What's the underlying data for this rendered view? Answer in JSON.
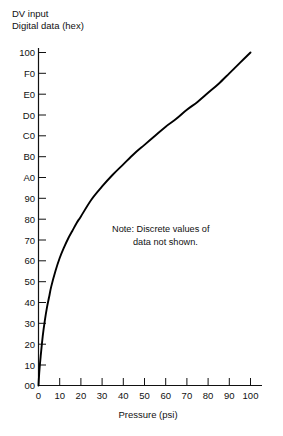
{
  "chart_data": {
    "type": "line",
    "title": "",
    "ylabel": "DV input\nDigital data (hex)",
    "ylabel_line1": "DV input",
    "ylabel_line2": "Digital data (hex)",
    "xlabel": "Pressure (psi)",
    "grid": false,
    "legend": null,
    "xlim": [
      0,
      105
    ],
    "ylim": [
      0,
      256
    ],
    "x_ticks": [
      0,
      10,
      20,
      30,
      40,
      50,
      60,
      70,
      80,
      90,
      100
    ],
    "x_tick_labels": [
      "0",
      "10",
      "20",
      "30",
      "40",
      "50",
      "60",
      "70",
      "80",
      "90",
      "100"
    ],
    "y_ticks": [
      0,
      16,
      32,
      48,
      64,
      80,
      96,
      112,
      128,
      144,
      160,
      176,
      192,
      208,
      224,
      240,
      256
    ],
    "y_tick_labels": [
      "00",
      "10",
      "20",
      "30",
      "40",
      "50",
      "60",
      "70",
      "80",
      "90",
      "A0",
      "B0",
      "C0",
      "D0",
      "E0",
      "F0",
      "100"
    ],
    "annotations": [
      {
        "name": "discrete-values-note",
        "line1": "Note:  Discrete values of",
        "line2": "data not shown.",
        "x": 40,
        "y": 120
      }
    ],
    "series": [
      {
        "name": "pressure-to-digital-response",
        "x": [
          0,
          0.4,
          1,
          2,
          3,
          4,
          5,
          6,
          8,
          10,
          12,
          14,
          16,
          18,
          20,
          25,
          30,
          35,
          40,
          45,
          50,
          55,
          60,
          65,
          70,
          75,
          80,
          85,
          90,
          95,
          100
        ],
        "y": [
          0,
          11,
          22,
          38,
          50,
          60,
          68,
          76,
          88,
          98,
          106,
          113,
          119,
          125,
          130,
          143,
          153,
          162,
          170,
          178,
          185,
          192,
          199,
          205,
          212,
          218,
          225,
          232,
          240,
          248,
          256
        ]
      }
    ]
  }
}
